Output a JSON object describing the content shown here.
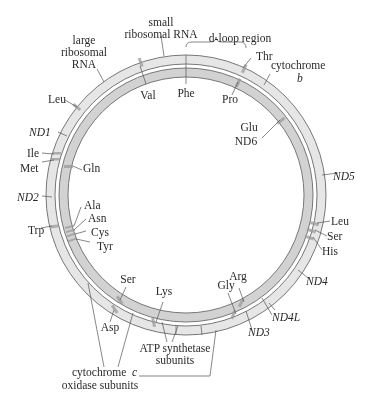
{
  "figure": {
    "type": "circular genome map",
    "colors": {
      "outer_ring": "#e6e6e6",
      "inner_ring": "#cfcfcf",
      "ring_border": "#6a6a6a",
      "trna_band": "#9a9a9a",
      "text": "#2a2a2a"
    }
  },
  "labels": {
    "small_rrna_1": "small",
    "small_rrna_2": "ribosomal RNA",
    "large_rrna_1": "large",
    "large_rrna_2": "ribosomal",
    "large_rrna_3": "RNA",
    "dloop": "d-loop region",
    "thr": "Thr",
    "cytb_1": "cytochrome",
    "cytb_2": "b",
    "phe": "Phe",
    "val": "Val",
    "pro": "Pro",
    "leu_top": "Leu",
    "nd1": "ND1",
    "glu": "Glu",
    "nd6": "ND6",
    "ile": "Ile",
    "met": "Met",
    "gln": "Gln",
    "nd5": "ND5",
    "nd2": "ND2",
    "ala": "Ala",
    "asn": "Asn",
    "trp": "Trp",
    "cys": "Cys",
    "tyr": "Tyr",
    "leu_right": "Leu",
    "ser_right": "Ser",
    "his": "His",
    "nd4": "ND4",
    "ser_bottom": "Ser",
    "lys": "Lys",
    "arg": "Arg",
    "gly": "Gly",
    "nd4l": "ND4L",
    "asp": "Asp",
    "nd3": "ND3",
    "atp_1": "ATP synthetase",
    "atp_2": "subunits",
    "cox_1": "cytochrome",
    "cox_c": "c",
    "cox_2": "oxidase subunits"
  }
}
